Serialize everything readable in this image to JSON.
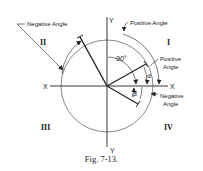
{
  "figure": {
    "caption": "Fig. 7-13.",
    "axes": {
      "x_left": "X",
      "x_right": "X",
      "y_top": "Y",
      "y_bottom": "Y"
    },
    "quadrants": {
      "q1": "I",
      "q2": "II",
      "q3": "III",
      "q4": "IV"
    },
    "labels": {
      "negative_angle_top": "Negative Angle",
      "positive_angle_top": "Positive Angle",
      "positive_angle_right_1": "Positive",
      "positive_angle_right_2": "Angle",
      "negative_angle_right_1": "Negative",
      "negative_angle_right_2": "Angle",
      "ninety": "90°",
      "alpha": "α",
      "beta": "β"
    },
    "colors": {
      "stroke": "#222222",
      "background": "#ffffff"
    }
  }
}
